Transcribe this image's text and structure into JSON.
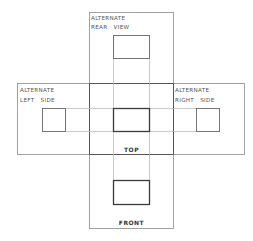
{
  "diagram": {
    "colors": {
      "background": "#ffffff",
      "frame_line": "#8a8a8a",
      "projection_line": "#b5b5b5",
      "view_box_line": "#666666",
      "main_box_line": "#3a3a3a"
    },
    "views": {
      "rear": {
        "label_line1": "ALTERNATE",
        "label_line2": "REAR   VIEW"
      },
      "left": {
        "label_line1": "ALTERNATE",
        "label_line2": "LEFT   SIDE"
      },
      "right": {
        "label_line1": "ALTERNATE",
        "label_line2": "RIGHT   SIDE"
      },
      "top": {
        "label": "TOP"
      },
      "front": {
        "label": "FRONT"
      }
    }
  }
}
